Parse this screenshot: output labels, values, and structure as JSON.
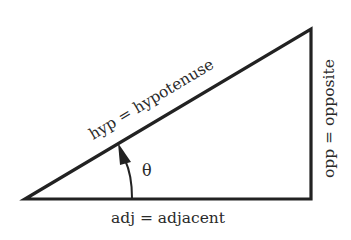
{
  "diagram": {
    "colors": {
      "stroke": "#222222",
      "text": "#2a2a2a",
      "background": "#ffffff"
    },
    "vertices": {
      "angle_vertex": [
        25,
        199
      ],
      "right_angle_vertex": [
        311,
        199
      ],
      "top_vertex": [
        311,
        29
      ]
    },
    "labels": {
      "hypotenuse": "hyp = hypotenuse",
      "opposite": "opp = opposite",
      "adjacent": "adj = adjacent",
      "angle": "θ"
    }
  }
}
